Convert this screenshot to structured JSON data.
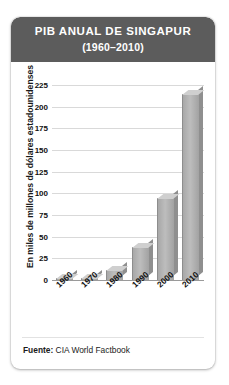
{
  "card": {
    "header": {
      "title": "PIB ANUAL DE SINGAPUR",
      "subtitle": "(1960–2010)",
      "background_color": "#5c5c5c",
      "text_color": "#ffffff"
    },
    "footer": {
      "label": "Fuente:",
      "source": "CIA World Factbook"
    }
  },
  "chart_data": {
    "type": "bar",
    "title": "PIB ANUAL DE SINGAPUR (1960–2010)",
    "categories": [
      "1960",
      "1970",
      "1980",
      "1990",
      "2000",
      "2010"
    ],
    "values": [
      0.7,
      2,
      12,
      38,
      95,
      215
    ],
    "series": [
      {
        "name": "PIB anual de Singapur",
        "values": [
          0.7,
          2,
          12,
          38,
          95,
          215
        ]
      }
    ],
    "xlabel": "",
    "ylabel": "En miles de millones de dólares estadounidenses",
    "ylim": [
      0,
      225
    ],
    "ytick_labels": [
      "225",
      "200",
      "175",
      "150",
      "125",
      "100",
      "75",
      "50",
      "25",
      "0"
    ],
    "ytick_values": [
      225,
      200,
      175,
      150,
      125,
      100,
      75,
      50,
      25,
      0
    ],
    "ytick_step": 25,
    "grid": true,
    "legend": "none",
    "bar_style": "3d",
    "bar_color": "#b0b0b0",
    "grid_color": "#d9d9d9",
    "source": "CIA World Factbook"
  }
}
